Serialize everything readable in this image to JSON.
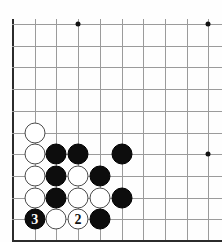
{
  "diagram": {
    "board": {
      "background_color": "#fefefe",
      "grid_color": "#9b9b9b",
      "edge_color": "#2b2b2b",
      "cell_size": 21.7,
      "origin_x": 13,
      "origin_y": 24,
      "columns": 10,
      "rows": 10,
      "left_edge_label": "board-left-edge",
      "bottom_edge_label": "board-bottom-edge"
    },
    "star_points": [
      {
        "name": "star-point-top-left",
        "col": 3,
        "row": 0
      },
      {
        "name": "star-point-top-right",
        "col": 9,
        "row": 0
      },
      {
        "name": "star-point-right-middle",
        "col": 9,
        "row": 6
      }
    ],
    "stones": [
      {
        "name": "white-stone-c5",
        "color": "white",
        "col": 1,
        "row": 5,
        "label": ""
      },
      {
        "name": "white-stone-c4",
        "color": "white",
        "col": 1,
        "row": 6,
        "label": ""
      },
      {
        "name": "black-stone-d4",
        "color": "black",
        "col": 2,
        "row": 6,
        "label": ""
      },
      {
        "name": "black-stone-e4",
        "color": "black",
        "col": 3,
        "row": 6,
        "label": ""
      },
      {
        "name": "black-stone-g4",
        "color": "black",
        "col": 5,
        "row": 6,
        "label": ""
      },
      {
        "name": "white-stone-c3",
        "color": "white",
        "col": 1,
        "row": 7,
        "label": ""
      },
      {
        "name": "black-stone-d3",
        "color": "black",
        "col": 2,
        "row": 7,
        "label": ""
      },
      {
        "name": "white-stone-e3",
        "color": "white",
        "col": 3,
        "row": 7,
        "label": ""
      },
      {
        "name": "black-stone-f3",
        "color": "black",
        "col": 4,
        "row": 7,
        "label": ""
      },
      {
        "name": "white-stone-c2",
        "color": "white",
        "col": 1,
        "row": 8,
        "label": ""
      },
      {
        "name": "black-stone-d2",
        "color": "black",
        "col": 2,
        "row": 8,
        "label": ""
      },
      {
        "name": "white-stone-e2",
        "color": "white",
        "col": 3,
        "row": 8,
        "label": ""
      },
      {
        "name": "white-stone-f2",
        "color": "white",
        "col": 4,
        "row": 8,
        "label": ""
      },
      {
        "name": "black-stone-g2",
        "color": "black",
        "col": 5,
        "row": 8,
        "label": ""
      },
      {
        "name": "black-stone-move-3",
        "color": "black",
        "col": 1,
        "row": 9,
        "label": "3"
      },
      {
        "name": "white-stone-d1",
        "color": "white",
        "col": 2,
        "row": 9,
        "label": ""
      },
      {
        "name": "white-stone-move-2",
        "color": "white",
        "col": 3,
        "row": 9,
        "label": "2"
      },
      {
        "name": "black-stone-f1",
        "color": "black",
        "col": 4,
        "row": 9,
        "label": ""
      }
    ],
    "move_numbers": [
      {
        "number": "2",
        "stone_color": "white"
      },
      {
        "number": "3",
        "stone_color": "black"
      }
    ],
    "colors": {
      "black_stone": "#0d0d0d",
      "white_stone": "#ffffff",
      "white_stone_outline": "#4a4a4a",
      "grid": "#9b9b9b",
      "edge": "#2b2b2b",
      "board_bg": "#fefefe"
    }
  }
}
